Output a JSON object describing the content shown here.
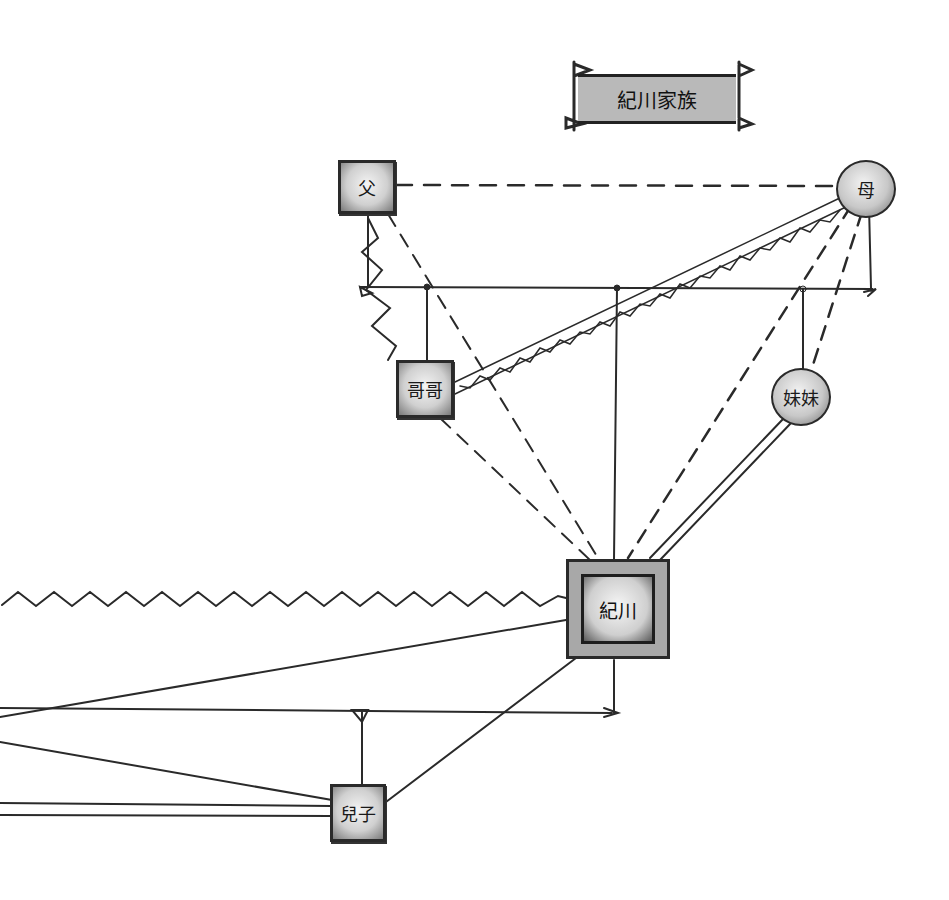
{
  "diagram": {
    "type": "genogram",
    "title": "紀川家族",
    "nodes": {
      "father": {
        "label": "父",
        "shape": "square",
        "gender": "male"
      },
      "mother": {
        "label": "母",
        "shape": "circle",
        "gender": "female"
      },
      "brother": {
        "label": "哥哥",
        "shape": "square",
        "gender": "male"
      },
      "sister": {
        "label": "妹妹",
        "shape": "circle",
        "gender": "female"
      },
      "self": {
        "label": "紀川",
        "shape": "double-square",
        "role": "index person"
      },
      "son": {
        "label": "兒子",
        "shape": "square",
        "gender": "male"
      }
    },
    "relationships": [
      {
        "from": "父",
        "to": "母",
        "style": "dashed",
        "meaning": "distant"
      },
      {
        "from": "父",
        "to": "哥哥",
        "style": "zigzag",
        "meaning": "conflict"
      },
      {
        "from": "父",
        "to": "紀川",
        "style": "dashed",
        "meaning": "distant"
      },
      {
        "from": "母",
        "to": "哥哥",
        "style": "truss",
        "meaning": "fused/close"
      },
      {
        "from": "母",
        "to": "紀川",
        "style": "dashed",
        "meaning": "distant"
      },
      {
        "from": "母",
        "to": "妹妹",
        "style": "dashed",
        "meaning": "distant"
      },
      {
        "from": "哥哥",
        "to": "紀川",
        "style": "dashed",
        "meaning": "distant"
      },
      {
        "from": "妹妹",
        "to": "紀川",
        "style": "double-line",
        "meaning": "close"
      },
      {
        "from": "紀川",
        "to": "off-left",
        "style": "zigzag",
        "meaning": "conflict"
      },
      {
        "from": "紀川",
        "to": "兒子",
        "style": "solid",
        "meaning": "normal"
      },
      {
        "from": "紀川",
        "to": "off-left",
        "style": "solid",
        "meaning": "normal"
      },
      {
        "from": "兒子",
        "to": "off-left",
        "style": "double-line",
        "meaning": "close"
      },
      {
        "from": "兒子",
        "to": "off-left",
        "style": "solid",
        "meaning": "normal"
      }
    ],
    "colors": {
      "ink": "#2a2a2a",
      "fill_light": "#f2f2f2",
      "fill_mid": "#c8c8c8",
      "title_fill": "#b9b9b9",
      "background": "#ffffff"
    }
  }
}
